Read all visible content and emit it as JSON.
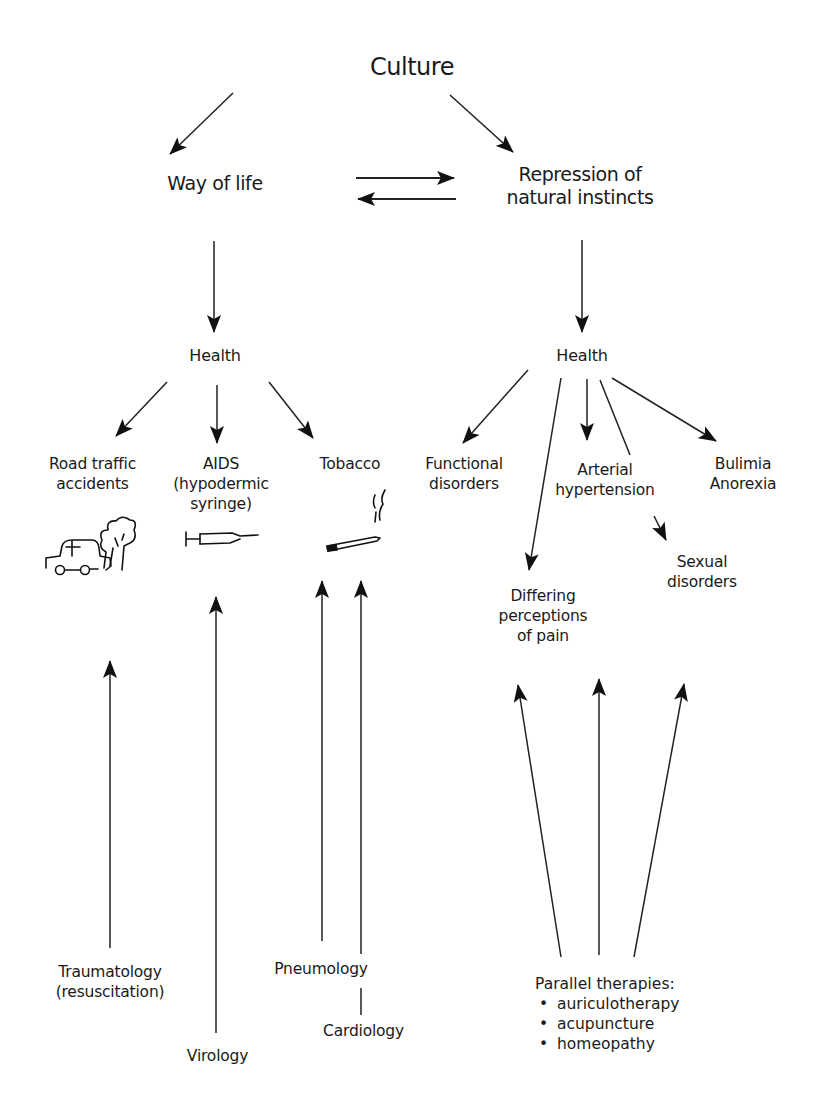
{
  "diagram": {
    "root": {
      "label": "Culture"
    },
    "branches": {
      "left": {
        "label": "Way of life"
      },
      "right": {
        "lines": [
          "Repression of",
          "natural instincts"
        ]
      }
    },
    "mutual_influence": {
      "forward": "Way of life → Repression of natural instincts",
      "backward": "Repression of natural instincts → Way of life"
    },
    "left_health": {
      "label": "Health",
      "outcomes": [
        {
          "lines": [
            "Road traffic",
            "accidents"
          ],
          "icon": "car-and-tree-icon"
        },
        {
          "lines": [
            "AIDS",
            "(hypodermic",
            "syringe)"
          ],
          "icon": "syringe-icon"
        },
        {
          "lines": [
            "Tobacco"
          ],
          "icon": "cigarette-icon"
        }
      ],
      "specialties": [
        {
          "lines": [
            "Traumatology",
            "(resuscitation)"
          ],
          "targets": "Road traffic accidents"
        },
        {
          "lines": [
            "Virology"
          ],
          "targets": "AIDS"
        },
        {
          "lines": [
            "Pneumology"
          ],
          "targets": "Tobacco"
        },
        {
          "lines": [
            "Cardiology"
          ],
          "targets": "Tobacco"
        }
      ]
    },
    "right_health": {
      "label": "Health",
      "outcomes": [
        {
          "lines": [
            "Functional",
            "disorders"
          ]
        },
        {
          "lines": [
            "Differing",
            "perceptions",
            "of pain"
          ]
        },
        {
          "lines": [
            "Arterial",
            "hypertension"
          ]
        },
        {
          "lines": [
            "Sexual",
            "disorders"
          ],
          "via": "Arterial hypertension"
        },
        {
          "lines": [
            "Bulimia",
            "Anorexia"
          ]
        }
      ],
      "therapies": {
        "title": "Parallel therapies:",
        "items": [
          "auriculotherapy",
          "acupuncture",
          "homeopathy"
        ]
      }
    }
  }
}
